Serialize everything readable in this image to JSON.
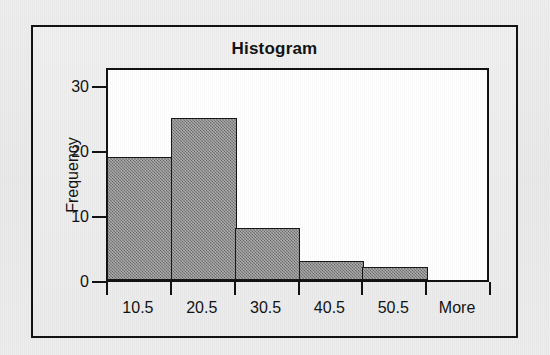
{
  "chart_data": {
    "type": "bar",
    "title": "Histogram",
    "xlabel": "",
    "ylabel": "Frequency",
    "categories": [
      "10.5",
      "20.5",
      "30.5",
      "40.5",
      "50.5",
      "More"
    ],
    "values": [
      19,
      25,
      8,
      3,
      2,
      0
    ],
    "ylim": [
      0,
      33
    ],
    "ytick_labels": [
      "0",
      "10",
      "20",
      "30"
    ],
    "ytick_values": [
      0,
      10,
      20,
      30
    ],
    "grid": false,
    "legend": false,
    "bar_fill_color": "#7d7d7d",
    "bar_border_color": "#141414",
    "plot_background": "#ffffff",
    "frame_color": "#101010",
    "page_background": "#ececec"
  }
}
